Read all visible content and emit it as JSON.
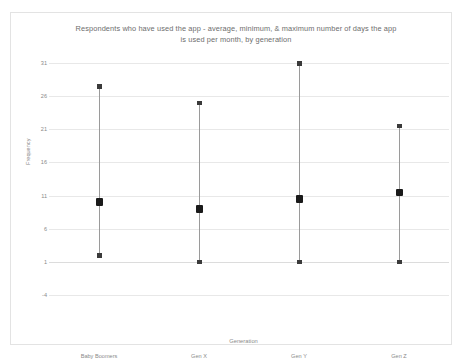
{
  "chart": {
    "title": "Respondents who have used the app - average, minimum, & maximum number of days the app is used per month, by generation",
    "title_line1": "Respondents who have used the app - average, minimum, & maximum number of days the app",
    "title_line2": "is used per month, by generation",
    "y_axis_title": "Frequency",
    "x_axis_title": "Generation"
  },
  "chart_data": {
    "type": "scatter",
    "title": "Respondents who have used the app - average, minimum, & maximum number of days the app is used per month, by generation",
    "xlabel": "Generation",
    "ylabel": "Frequency",
    "categories": [
      "Baby Boomers",
      "Gen X",
      "Gen Y",
      "Gen Z"
    ],
    "ylim": [
      -4,
      31
    ],
    "yticks": [
      31,
      26,
      21,
      16,
      11,
      6,
      1,
      -4
    ],
    "grid": true,
    "legend": "none",
    "series": [
      {
        "name": "Average",
        "values": [
          10,
          9,
          10.5,
          11.5
        ]
      },
      {
        "name": "Minimum",
        "values": [
          2,
          1,
          1,
          1
        ]
      },
      {
        "name": "Maximum",
        "values": [
          27.5,
          25,
          31,
          21.5
        ]
      }
    ],
    "points": [
      {
        "category": "Baby Boomers",
        "min": 2,
        "average": 10,
        "max": 27.5
      },
      {
        "category": "Gen X",
        "min": 1,
        "average": 9,
        "max": 25
      },
      {
        "category": "Gen Y",
        "min": 1,
        "average": 10.5,
        "max": 31
      },
      {
        "category": "Gen Z",
        "min": 1,
        "average": 11.5,
        "max": 21.5
      }
    ],
    "colors": {
      "marker": "#1a1a1a",
      "line": "#9a9a9a",
      "grid": "#e8e8e8",
      "text": "#8a8a8a",
      "background": "#ffffff"
    }
  }
}
